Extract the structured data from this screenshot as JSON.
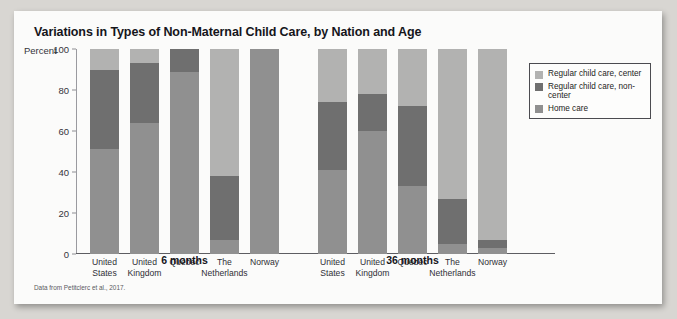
{
  "figure": {
    "title": "Variations in Types of Non-Maternal Child Care, by Nation and Age",
    "source_note": "Data from Petitclerc et al., 2017."
  },
  "legend": {
    "items": [
      {
        "label": "Regular child care, center",
        "color": "#b2b2b1",
        "key": "center"
      },
      {
        "label": "Regular child care, non-center",
        "color": "#6f6f6f",
        "key": "noncenter"
      },
      {
        "label": "Home care",
        "color": "#909090",
        "key": "home"
      }
    ]
  },
  "chart_data": {
    "type": "bar",
    "subtype": "stacked-bar-grouped",
    "title": "Variations in Types of Non-Maternal Child Care, by Nation and Age",
    "xlabel": "",
    "ylabel": "Percent",
    "ylim": [
      0,
      100
    ],
    "yticks": [
      0,
      20,
      40,
      60,
      80,
      100
    ],
    "grid": false,
    "legend_position": "right",
    "groups": [
      "6 months",
      "36 months"
    ],
    "categories": [
      "United States",
      "United Kingdom",
      "Québec",
      "The Netherlands",
      "Norway"
    ],
    "series": [
      {
        "name": "Regular child care, center",
        "color": "#b2b2b1",
        "values_6_months": [
          10,
          7,
          0,
          62,
          0
        ],
        "values_36_months": [
          26,
          22,
          28,
          73,
          93
        ]
      },
      {
        "name": "Regular child care, non-center",
        "color": "#6f6f6f",
        "values_6_months": [
          39,
          29,
          11,
          31,
          0
        ],
        "values_36_months": [
          33,
          18,
          39,
          22,
          4
        ]
      },
      {
        "name": "Home care",
        "color": "#909090",
        "values_6_months": [
          51,
          64,
          89,
          7,
          100
        ],
        "values_36_months": [
          41,
          60,
          33,
          5,
          3
        ]
      }
    ]
  },
  "axis": {
    "percent_label": "Percent",
    "tick_labels": [
      "100",
      "80",
      "60",
      "40",
      "20",
      "0"
    ]
  }
}
